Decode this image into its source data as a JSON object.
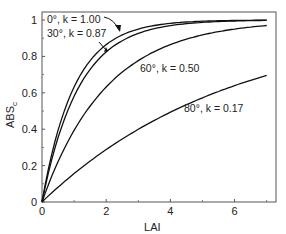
{
  "chart_data": {
    "type": "line",
    "title": "",
    "xlabel": "LAI",
    "ylabel": "ABSc",
    "ylabel_main": "ABS",
    "ylabel_sub": "c",
    "xlim": [
      0,
      7.2
    ],
    "ylim": [
      0,
      1.04
    ],
    "xticks": [
      0,
      2,
      4,
      6
    ],
    "xticks_minor": [
      1,
      3,
      5,
      7
    ],
    "yticks": [
      0,
      0.2,
      0.4,
      0.6,
      0.8,
      1
    ],
    "ytick_labels": [
      "0",
      "0.2",
      "0.4",
      "0.6",
      "0.8",
      "1"
    ],
    "grid": false,
    "x": [
      0,
      0.5,
      1,
      1.5,
      2,
      2.5,
      3,
      3.5,
      4,
      4.5,
      5,
      5.5,
      6,
      6.5,
      7
    ],
    "series": [
      {
        "name": "0°, k = 1.00",
        "k": 1.0,
        "values": [
          0,
          0.39,
          0.63,
          0.78,
          0.86,
          0.92,
          0.95,
          0.97,
          0.98,
          0.99,
          0.99,
          1.0,
          1.0,
          1.0,
          1.0
        ]
      },
      {
        "name": "30°, k = 0.87",
        "k": 0.87,
        "values": [
          0,
          0.35,
          0.58,
          0.73,
          0.82,
          0.89,
          0.93,
          0.95,
          0.97,
          0.98,
          0.99,
          0.99,
          0.99,
          1.0,
          1.0
        ]
      },
      {
        "name": "60°, k = 0.50",
        "k": 0.5,
        "values": [
          0,
          0.22,
          0.39,
          0.53,
          0.63,
          0.71,
          0.78,
          0.83,
          0.86,
          0.89,
          0.92,
          0.94,
          0.95,
          0.96,
          0.97
        ]
      },
      {
        "name": "80°, k = 0.17",
        "k": 0.17,
        "values": [
          0,
          0.08,
          0.16,
          0.22,
          0.29,
          0.35,
          0.4,
          0.45,
          0.49,
          0.53,
          0.57,
          0.61,
          0.64,
          0.67,
          0.7
        ]
      }
    ],
    "annotations": [
      {
        "text": "0°, k = 1.00",
        "arrow": true
      },
      {
        "text": "30°, k = 0.87",
        "arrow": true
      },
      {
        "text": "60°, k = 0.50"
      },
      {
        "text": "80°, k = 0.17"
      }
    ],
    "legend": "inline annotations"
  }
}
